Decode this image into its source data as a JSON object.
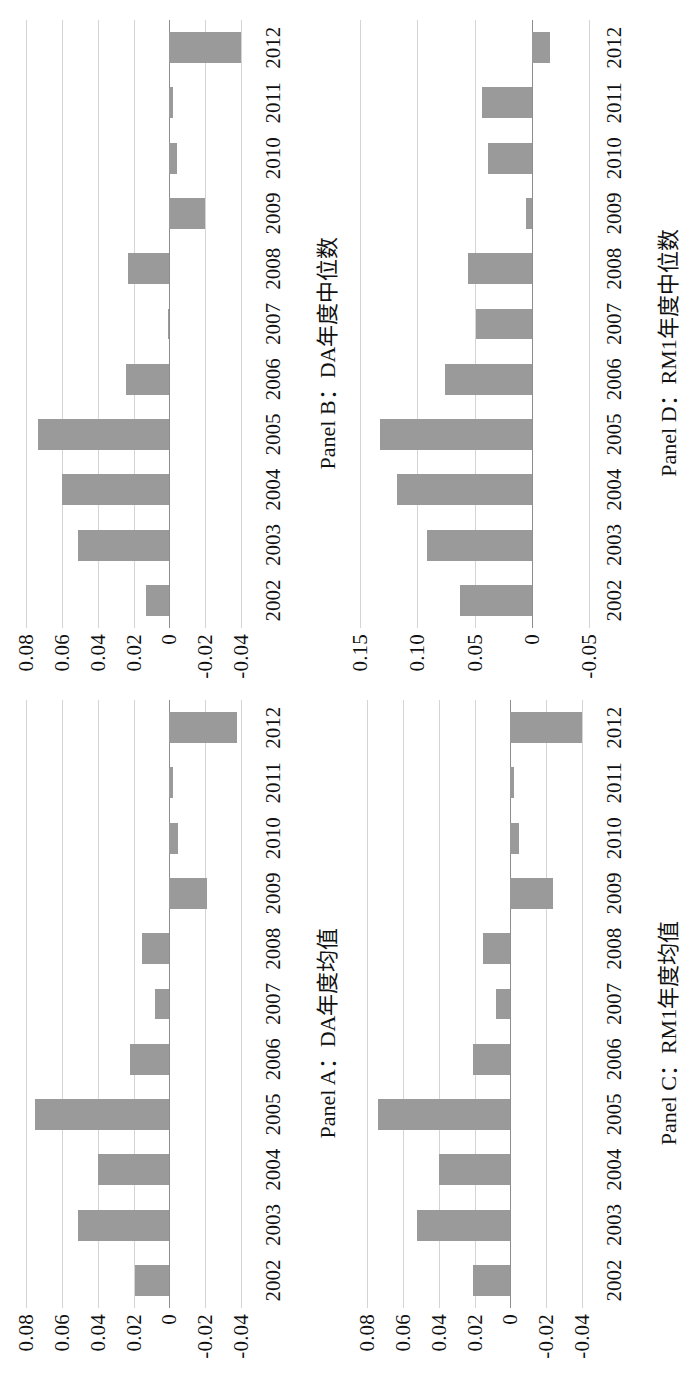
{
  "figure": {
    "orientation_note": "rotated",
    "bar_color": "#9a9a9a",
    "gridline_color": "#d4d4d4",
    "axis_color": "#8d8d8d",
    "categories": [
      "2002",
      "2003",
      "2004",
      "2005",
      "2006",
      "2007",
      "2008",
      "2009",
      "2010",
      "2011",
      "2012"
    ]
  },
  "panels": [
    {
      "id": "panel-a",
      "caption": "Panel A：DA年度均值",
      "yticks": [
        "0.08",
        "0.06",
        "0.04",
        "0.02",
        "0",
        "-0.02",
        "-0.04"
      ],
      "ytick_values": [
        0.08,
        0.06,
        0.04,
        0.02,
        0,
        -0.02,
        -0.04
      ],
      "ylim": [
        -0.05,
        0.09
      ]
    },
    {
      "id": "panel-b",
      "caption": "Panel B：DA年度中位数",
      "yticks": [
        "0.08",
        "0.06",
        "0.04",
        "0.02",
        "0",
        "-0.02",
        "-0.04"
      ],
      "ytick_values": [
        0.08,
        0.06,
        0.04,
        0.02,
        0,
        -0.02,
        -0.04
      ],
      "ylim": [
        -0.05,
        0.09
      ]
    },
    {
      "id": "panel-c",
      "caption": "Panel C：RM1年度均值",
      "yticks": [
        "0.08",
        "0.06",
        "0.04",
        "0.02",
        "0",
        "-0.02",
        "-0.04"
      ],
      "ytick_values": [
        0.08,
        0.06,
        0.04,
        0.02,
        0,
        -0.02,
        -0.04
      ],
      "ylim": [
        -0.05,
        0.09
      ]
    },
    {
      "id": "panel-d",
      "caption": "Panel D：RM1年度中位数",
      "yticks": [
        "0.15",
        "0.10",
        "0.05",
        "0",
        "-0.05"
      ],
      "ytick_values": [
        0.15,
        0.1,
        0.05,
        0,
        -0.05
      ],
      "ylim": [
        -0.06,
        0.16
      ]
    }
  ],
  "chart_data": [
    {
      "type": "bar",
      "id": "panel-a",
      "title": "Panel A：DA年度均值",
      "xlabel": "",
      "ylabel": "",
      "categories": [
        "2002",
        "2003",
        "2004",
        "2005",
        "2006",
        "2007",
        "2008",
        "2009",
        "2010",
        "2011",
        "2012"
      ],
      "values": [
        0.019,
        0.051,
        0.04,
        0.075,
        0.022,
        0.008,
        0.015,
        -0.021,
        -0.005,
        -0.002,
        -0.038
      ],
      "ylim": [
        -0.05,
        0.09
      ],
      "yticks": [
        0.08,
        0.06,
        0.04,
        0.02,
        0,
        -0.02,
        -0.04
      ],
      "grid": true,
      "legend": "none"
    },
    {
      "type": "bar",
      "id": "panel-b",
      "title": "Panel B：DA年度中位数",
      "xlabel": "",
      "ylabel": "",
      "categories": [
        "2002",
        "2003",
        "2004",
        "2005",
        "2006",
        "2007",
        "2008",
        "2009",
        "2010",
        "2011",
        "2012"
      ],
      "values": [
        0.013,
        0.051,
        0.06,
        0.073,
        0.024,
        0.001,
        0.023,
        -0.02,
        -0.004,
        -0.002,
        -0.04
      ],
      "ylim": [
        -0.05,
        0.09
      ],
      "yticks": [
        0.08,
        0.06,
        0.04,
        0.02,
        0,
        -0.02,
        -0.04
      ],
      "grid": true,
      "legend": "none"
    },
    {
      "type": "bar",
      "id": "panel-c",
      "title": "Panel C：RM1年度均值",
      "xlabel": "",
      "ylabel": "",
      "categories": [
        "2002",
        "2003",
        "2004",
        "2005",
        "2006",
        "2007",
        "2008",
        "2009",
        "2010",
        "2011",
        "2012"
      ],
      "values": [
        0.021,
        0.052,
        0.04,
        0.074,
        0.021,
        0.008,
        0.015,
        -0.024,
        -0.005,
        -0.002,
        -0.04
      ],
      "ylim": [
        -0.05,
        0.09
      ],
      "yticks": [
        0.08,
        0.06,
        0.04,
        0.02,
        0,
        -0.02,
        -0.04
      ],
      "grid": true,
      "legend": "none"
    },
    {
      "type": "bar",
      "id": "panel-d",
      "title": "Panel D：RM1年度中位数",
      "xlabel": "",
      "ylabel": "",
      "categories": [
        "2002",
        "2003",
        "2004",
        "2005",
        "2006",
        "2007",
        "2008",
        "2009",
        "2010",
        "2011",
        "2012"
      ],
      "values": [
        0.063,
        0.092,
        0.118,
        0.133,
        0.076,
        0.049,
        0.056,
        0.005,
        0.038,
        0.043,
        -0.016
      ],
      "ylim": [
        -0.06,
        0.16
      ],
      "yticks": [
        0.15,
        0.1,
        0.05,
        0,
        -0.05
      ],
      "grid": true,
      "legend": "none"
    }
  ]
}
